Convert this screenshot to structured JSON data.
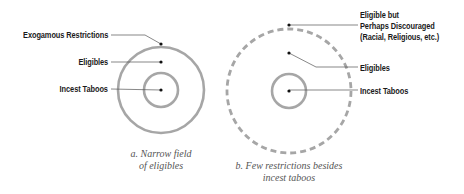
{
  "diagrams": [
    {
      "id": "a",
      "caption_line1": "a. Narrow field",
      "caption_line2": "of eligibles",
      "labels": {
        "outer": "Exogamous Restrictions",
        "middle": "Eligibles",
        "inner": "Incest Taboos"
      },
      "outer_ring_style": "solid"
    },
    {
      "id": "b",
      "caption_line1": "b. Few restrictions besides",
      "caption_line2": "incest taboos",
      "labels": {
        "outer_line1": "Eligible but",
        "outer_line2": "Perhaps Discouraged",
        "outer_line3": "(Racial, Religious, etc.)",
        "middle": "Eligibles",
        "inner": "Incest Taboos"
      },
      "outer_ring_style": "dashed"
    }
  ],
  "colors": {
    "ring": "#a6a6a6",
    "leader": "#555555",
    "dot": "#111111",
    "label": "#1a1a1a",
    "caption": "#555555"
  }
}
